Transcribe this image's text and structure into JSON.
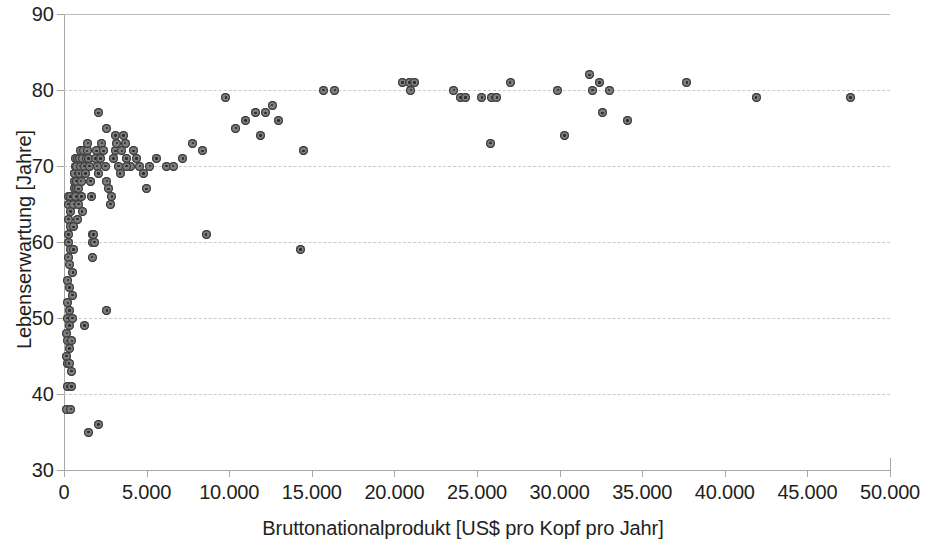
{
  "chart_data": {
    "type": "scatter",
    "title": "",
    "xlabel": "Bruttonationalprodukt [US$ pro Kopf pro Jahr]",
    "ylabel": "Lebenserwartung [Jahre]",
    "xlim": [
      0,
      50000
    ],
    "ylim": [
      30,
      90
    ],
    "xticks": [
      0,
      5000,
      10000,
      15000,
      20000,
      25000,
      30000,
      35000,
      40000,
      45000,
      50000
    ],
    "xticklabels": [
      "0",
      "5.000",
      "10.000",
      "15.000",
      "20.000",
      "25.000",
      "30.000",
      "35.000",
      "40.000",
      "45.000",
      "50.000"
    ],
    "yticks": [
      30,
      40,
      50,
      60,
      70,
      80,
      90
    ],
    "yticklabels": [
      "30",
      "40",
      "50",
      "60",
      "70",
      "80",
      "90"
    ],
    "grid": "horizontal-dashed",
    "legend": "none",
    "marker_color": "#7d7d7d",
    "marker_edge_color": "#3a3a3a",
    "gridline_color": "#c9c9c9",
    "axis_color": "#a8a8a8",
    "text_color": "#231f20",
    "series": [
      {
        "name": "Länder",
        "points": [
          [
            150,
            45
          ],
          [
            170,
            48
          ],
          [
            180,
            38
          ],
          [
            190,
            41
          ],
          [
            200,
            44
          ],
          [
            210,
            47
          ],
          [
            220,
            50
          ],
          [
            230,
            52
          ],
          [
            240,
            55
          ],
          [
            250,
            58
          ],
          [
            260,
            60
          ],
          [
            270,
            61
          ],
          [
            280,
            63
          ],
          [
            290,
            65
          ],
          [
            300,
            66
          ],
          [
            310,
            44
          ],
          [
            320,
            46
          ],
          [
            330,
            49
          ],
          [
            340,
            51
          ],
          [
            350,
            54
          ],
          [
            360,
            57
          ],
          [
            370,
            59
          ],
          [
            380,
            62
          ],
          [
            390,
            64
          ],
          [
            400,
            66
          ],
          [
            420,
            38
          ],
          [
            440,
            41
          ],
          [
            460,
            43
          ],
          [
            480,
            47
          ],
          [
            500,
            50
          ],
          [
            520,
            53
          ],
          [
            540,
            56
          ],
          [
            560,
            59
          ],
          [
            580,
            62
          ],
          [
            600,
            65
          ],
          [
            620,
            67
          ],
          [
            640,
            68
          ],
          [
            660,
            69
          ],
          [
            680,
            70
          ],
          [
            700,
            71
          ],
          [
            720,
            66
          ],
          [
            740,
            67
          ],
          [
            760,
            68
          ],
          [
            780,
            70
          ],
          [
            800,
            71
          ],
          [
            830,
            63
          ],
          [
            860,
            65
          ],
          [
            890,
            67
          ],
          [
            920,
            69
          ],
          [
            950,
            71
          ],
          [
            980,
            72
          ],
          [
            1010,
            70
          ],
          [
            1040,
            68
          ],
          [
            1070,
            66
          ],
          [
            1100,
            64
          ],
          [
            1150,
            71
          ],
          [
            1200,
            72
          ],
          [
            1250,
            70
          ],
          [
            1300,
            69
          ],
          [
            1350,
            71
          ],
          [
            1400,
            72
          ],
          [
            1450,
            73
          ],
          [
            1500,
            71
          ],
          [
            1550,
            70
          ],
          [
            1600,
            68
          ],
          [
            1650,
            66
          ],
          [
            1700,
            61
          ],
          [
            1750,
            60
          ],
          [
            1800,
            61
          ],
          [
            1850,
            60
          ],
          [
            1900,
            71
          ],
          [
            1950,
            72
          ],
          [
            2000,
            70
          ],
          [
            2100,
            69
          ],
          [
            2200,
            71
          ],
          [
            2300,
            73
          ],
          [
            2400,
            72
          ],
          [
            2500,
            70
          ],
          [
            2600,
            68
          ],
          [
            2700,
            67
          ],
          [
            2800,
            65
          ],
          [
            2900,
            66
          ],
          [
            3000,
            71
          ],
          [
            3100,
            72
          ],
          [
            3200,
            73
          ],
          [
            3300,
            70
          ],
          [
            3400,
            69
          ],
          [
            3500,
            72
          ],
          [
            3600,
            74
          ],
          [
            3700,
            73
          ],
          [
            3800,
            71
          ],
          [
            4000,
            70
          ],
          [
            4200,
            72
          ],
          [
            4400,
            71
          ],
          [
            4600,
            70
          ],
          [
            4800,
            69
          ],
          [
            5000,
            67
          ],
          [
            2100,
            77
          ],
          [
            2600,
            75
          ],
          [
            3100,
            74
          ],
          [
            1250,
            49
          ],
          [
            1500,
            35
          ],
          [
            2100,
            36
          ],
          [
            1700,
            58
          ],
          [
            2600,
            51
          ],
          [
            3800,
            70
          ],
          [
            5200,
            70
          ],
          [
            5600,
            71
          ],
          [
            6200,
            70
          ],
          [
            6600,
            70
          ],
          [
            7200,
            71
          ],
          [
            7800,
            73
          ],
          [
            8400,
            72
          ],
          [
            8600,
            61
          ],
          [
            9800,
            79
          ],
          [
            10400,
            75
          ],
          [
            11000,
            76
          ],
          [
            11600,
            77
          ],
          [
            11900,
            74
          ],
          [
            12200,
            77
          ],
          [
            12600,
            78
          ],
          [
            13000,
            76
          ],
          [
            14300,
            59
          ],
          [
            14500,
            72
          ],
          [
            15700,
            80
          ],
          [
            16400,
            80
          ],
          [
            20500,
            81
          ],
          [
            20900,
            81
          ],
          [
            21200,
            81
          ],
          [
            21000,
            80
          ],
          [
            23600,
            80
          ],
          [
            24000,
            79
          ],
          [
            24300,
            79
          ],
          [
            25300,
            79
          ],
          [
            25900,
            79
          ],
          [
            26200,
            79
          ],
          [
            27000,
            81
          ],
          [
            29900,
            80
          ],
          [
            30300,
            74
          ],
          [
            31800,
            82
          ],
          [
            32000,
            80
          ],
          [
            32400,
            81
          ],
          [
            33000,
            80
          ],
          [
            32600,
            77
          ],
          [
            25800,
            73
          ],
          [
            37700,
            81
          ],
          [
            34100,
            76
          ],
          [
            41900,
            79
          ],
          [
            47600,
            79
          ]
        ]
      }
    ]
  },
  "axis_titles": {
    "x": "Bruttonationalprodukt [US$ pro Kopf pro Jahr]",
    "y": "Lebenserwartung [Jahre]"
  }
}
